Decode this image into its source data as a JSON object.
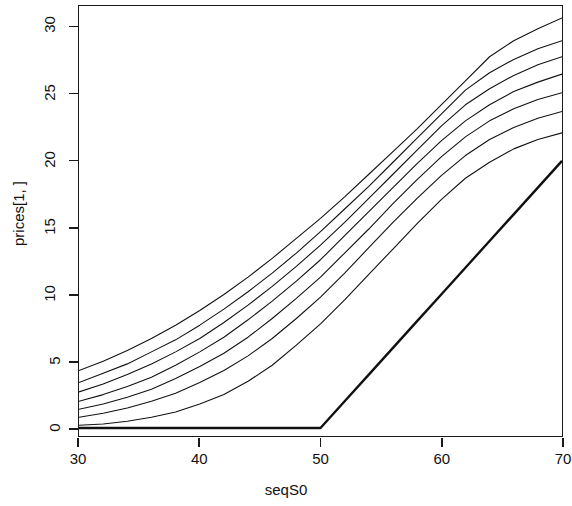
{
  "chart_data": {
    "type": "line",
    "title": "",
    "xlabel": "seqS0",
    "ylabel": "prices[1, ]",
    "xlim": [
      30,
      70
    ],
    "ylim": [
      -0.6,
      31.6
    ],
    "xticks": [
      30,
      40,
      50,
      60,
      70
    ],
    "yticks": [
      0,
      5,
      10,
      15,
      20,
      25,
      30
    ],
    "grid": false,
    "legend": "none",
    "box": true,
    "x": [
      30,
      32,
      34,
      36,
      38,
      40,
      42,
      44,
      46,
      48,
      50,
      52,
      54,
      56,
      58,
      60,
      62,
      64,
      66,
      68,
      70
    ],
    "series": [
      {
        "name": "curve-7-longest-maturity",
        "color": "#111111",
        "width": 1.1,
        "values": [
          4.3,
          5.0,
          5.8,
          6.7,
          7.7,
          8.8,
          10.0,
          11.3,
          12.7,
          14.2,
          15.7,
          17.3,
          19.0,
          20.7,
          22.4,
          24.2,
          26.0,
          27.8,
          29.0,
          29.9,
          30.7
        ]
      },
      {
        "name": "curve-6",
        "color": "#111111",
        "width": 1.1,
        "values": [
          3.4,
          4.1,
          4.8,
          5.7,
          6.6,
          7.7,
          8.9,
          10.2,
          11.6,
          13.1,
          14.7,
          16.4,
          18.1,
          19.9,
          21.7,
          23.5,
          25.3,
          26.6,
          27.6,
          28.4,
          29.0
        ]
      },
      {
        "name": "curve-5",
        "color": "#111111",
        "width": 1.1,
        "values": [
          2.7,
          3.3,
          4.0,
          4.8,
          5.7,
          6.7,
          7.9,
          9.2,
          10.6,
          12.1,
          13.7,
          15.4,
          17.2,
          19.0,
          20.8,
          22.6,
          24.2,
          25.4,
          26.4,
          27.2,
          27.8
        ]
      },
      {
        "name": "curve-4",
        "color": "#111111",
        "width": 1.1,
        "values": [
          2.0,
          2.5,
          3.1,
          3.8,
          4.7,
          5.7,
          6.8,
          8.1,
          9.5,
          11.0,
          12.6,
          14.4,
          16.2,
          18.0,
          19.8,
          21.5,
          23.0,
          24.2,
          25.2,
          25.9,
          26.5
        ]
      },
      {
        "name": "curve-3",
        "color": "#111111",
        "width": 1.1,
        "values": [
          1.4,
          1.8,
          2.3,
          2.9,
          3.7,
          4.6,
          5.6,
          6.8,
          8.2,
          9.7,
          11.3,
          13.1,
          14.9,
          16.8,
          18.6,
          20.3,
          21.8,
          23.0,
          23.9,
          24.6,
          25.1
        ]
      },
      {
        "name": "curve-2",
        "color": "#111111",
        "width": 1.1,
        "values": [
          0.8,
          1.1,
          1.5,
          2.0,
          2.6,
          3.4,
          4.3,
          5.4,
          6.7,
          8.2,
          9.8,
          11.6,
          13.5,
          15.4,
          17.2,
          18.9,
          20.4,
          21.6,
          22.5,
          23.2,
          23.7
        ]
      },
      {
        "name": "curve-1-shortest-maturity",
        "color": "#111111",
        "width": 1.1,
        "values": [
          0.2,
          0.3,
          0.5,
          0.8,
          1.2,
          1.8,
          2.5,
          3.5,
          4.7,
          6.2,
          7.8,
          9.6,
          11.5,
          13.4,
          15.3,
          17.1,
          18.7,
          19.9,
          20.9,
          21.6,
          22.1
        ]
      },
      {
        "name": "intrinsic-value-payoff",
        "color": "#111111",
        "width": 2.4,
        "values": [
          0,
          0,
          0,
          0,
          0,
          0,
          0,
          0,
          0,
          0,
          0,
          2,
          4,
          6,
          8,
          10,
          12,
          14,
          16,
          18,
          20
        ]
      }
    ]
  }
}
